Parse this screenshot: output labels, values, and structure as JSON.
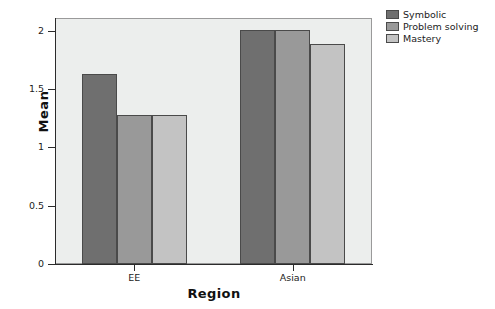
{
  "chart_data": {
    "type": "bar",
    "title": "",
    "xlabel": "Region",
    "ylabel": "Mean",
    "categories": [
      "EE",
      "Asian"
    ],
    "series": [
      {
        "name": "Symbolic",
        "values": [
          1.63,
          2.01
        ],
        "color": "#6f6f6f"
      },
      {
        "name": "Problem solving",
        "values": [
          1.28,
          2.01
        ],
        "color": "#999999"
      },
      {
        "name": "Mastery",
        "values": [
          1.28,
          1.89
        ],
        "color": "#c3c3c3"
      }
    ],
    "ylim": [
      0,
      2.11
    ],
    "yticks": [
      0,
      0.5,
      1,
      1.5,
      2
    ],
    "ytick_labels": [
      "0",
      "0.5",
      "1",
      "1.5",
      "2"
    ],
    "grid": false,
    "legend_position": "right",
    "plot_background": "#eceeed",
    "figure_background": "#ffffff",
    "axis_color": "#2b2b2b",
    "bar_edge_color": "#4a4a4a"
  }
}
